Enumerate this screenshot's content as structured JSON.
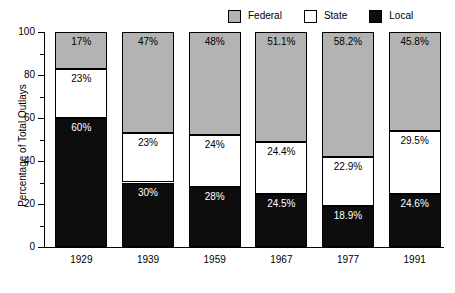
{
  "chart_data": {
    "type": "bar",
    "subtype": "stacked-percentage-column",
    "title": "",
    "xlabel": "",
    "ylabel": "Percentage of Total Outlays",
    "ylim": [
      0,
      100
    ],
    "ytick_major": [
      0,
      20,
      40,
      60,
      80,
      100
    ],
    "ytick_minor": [
      10,
      30,
      50,
      70,
      90
    ],
    "ytick_labels": [
      "0",
      "20",
      "40",
      "60",
      "80",
      "100"
    ],
    "grid": false,
    "legend_position": "top-right",
    "stack_order_bottom_to_top": [
      "Local",
      "State",
      "Federal"
    ],
    "categories": [
      "1929",
      "1939",
      "1959",
      "1967",
      "1977",
      "1991"
    ],
    "series": [
      {
        "name": "Federal",
        "color": "#b3b3b3",
        "values": [
          17,
          47,
          48,
          51.1,
          58.2,
          45.8
        ],
        "labels": [
          "17%",
          "47%",
          "48%",
          "51.1%",
          "58.2%",
          "45.8%"
        ]
      },
      {
        "name": "State",
        "color": "#ffffff",
        "values": [
          23,
          23,
          24,
          24.4,
          22.9,
          29.5
        ],
        "labels": [
          "23%",
          "23%",
          "24%",
          "24.4%",
          "22.9%",
          "29.5%"
        ]
      },
      {
        "name": "Local",
        "color": "#0d0d0d",
        "values": [
          60,
          30,
          28,
          24.5,
          18.9,
          24.6
        ],
        "labels": [
          "60%",
          "30%",
          "28%",
          "24.5%",
          "18.9%",
          "24.6%"
        ]
      }
    ]
  },
  "legend": {
    "items": [
      {
        "label": "Federal",
        "color": "#b3b3b3"
      },
      {
        "label": "State",
        "color": "#ffffff"
      },
      {
        "label": "Local",
        "color": "#0d0d0d"
      }
    ]
  },
  "axis": {
    "y_title": "Percentage of Total Outlays"
  }
}
